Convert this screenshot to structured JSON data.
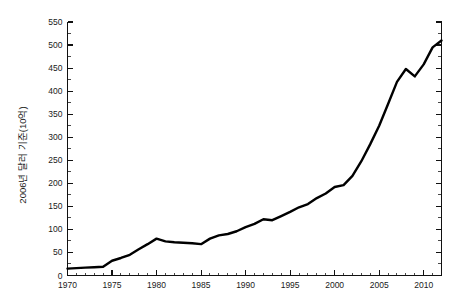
{
  "chart_data": {
    "type": "line",
    "title": "",
    "subtitle": "",
    "xlabel": "",
    "ylabel": "2006년 달러 기준(10억)",
    "xlim": [
      1970,
      2012
    ],
    "ylim": [
      0,
      550
    ],
    "y_ticks": [
      0,
      50,
      100,
      150,
      200,
      250,
      300,
      350,
      400,
      450,
      500,
      550
    ],
    "y_tick_labels": [
      "0",
      "50",
      "100",
      "150",
      "200",
      "250",
      "300",
      "350",
      "400",
      "450",
      "500",
      "550"
    ],
    "y_minor_step": 25,
    "x_ticks": [
      1970,
      1975,
      1980,
      1985,
      1990,
      1995,
      2000,
      2005,
      2010
    ],
    "x_tick_labels": [
      "1970",
      "1975",
      "1980",
      "1985",
      "1990",
      "1995",
      "2000",
      "2005",
      "2010"
    ],
    "x_minor_step": 1,
    "grid": false,
    "legend": null,
    "line_color": "#000000",
    "series": [
      {
        "name": "series-1",
        "x": [
          1970,
          1971,
          1972,
          1973,
          1974,
          1975,
          1976,
          1977,
          1978,
          1979,
          1980,
          1981,
          1982,
          1983,
          1984,
          1985,
          1986,
          1987,
          1988,
          1989,
          1990,
          1991,
          1992,
          1993,
          1994,
          1995,
          1996,
          1997,
          1998,
          1999,
          2000,
          2001,
          2002,
          2003,
          2004,
          2005,
          2006,
          2007,
          2008,
          2009,
          2010,
          2011,
          2012
        ],
        "values": [
          15,
          16,
          17,
          18,
          19,
          32,
          38,
          45,
          57,
          68,
          80,
          74,
          72,
          71,
          70,
          68,
          80,
          87,
          90,
          96,
          105,
          112,
          122,
          120,
          129,
          138,
          148,
          155,
          168,
          178,
          192,
          196,
          216,
          248,
          285,
          325,
          372,
          420,
          448,
          432,
          458,
          495,
          510
        ]
      }
    ]
  }
}
